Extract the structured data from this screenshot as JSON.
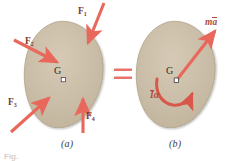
{
  "figure": {
    "kind": "free-body-and-kinetic-diagram",
    "panel_a": {
      "caption": "(a)",
      "body_label": "G",
      "forces": [
        {
          "name": "F1",
          "label": "F",
          "subscript": "1"
        },
        {
          "name": "F2",
          "label": "F",
          "subscript": "2"
        },
        {
          "name": "F3",
          "label": "F",
          "subscript": "3"
        },
        {
          "name": "F4",
          "label": "F",
          "subscript": "4"
        }
      ]
    },
    "equals_sign": "=",
    "panel_b": {
      "caption": "(b)",
      "body_label": "G",
      "resultant_force_label": "ma",
      "resultant_force_parts": {
        "mass": "m",
        "accel": "a"
      },
      "moment_label": "Ia",
      "moment_parts": {
        "inertia": "I",
        "alpha": "α"
      }
    },
    "bottom_caption": "Fig.",
    "colors": {
      "body_fill": "#c9bca6",
      "body_fill_light": "#d3c7b2",
      "body_stroke": "#a89madd",
      "arrow": "#e8685c",
      "arrow_dark": "#d4564a",
      "label_dark": "#7b3a30",
      "vector_label": "#b04a3f",
      "equals": "#e8736a",
      "text": "#2b2b2b",
      "background": "#ffffff"
    }
  }
}
